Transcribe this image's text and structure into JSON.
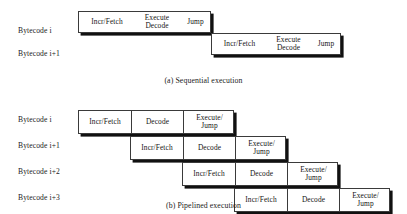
{
  "figure": {
    "sequential": {
      "caption": "(a) Sequential execution",
      "rows": [
        {
          "label": "Bytecode i",
          "stages": [
            {
              "name": "incr-fetch",
              "lines": [
                "Incr/Fetch"
              ]
            },
            {
              "name": "execute-decode",
              "lines": [
                "Execute",
                "Decode"
              ]
            },
            {
              "name": "jump",
              "lines": [
                "Jump"
              ]
            }
          ]
        },
        {
          "label": "Bytecode i+1",
          "stages": [
            {
              "name": "incr-fetch",
              "lines": [
                "Incr/Fetch"
              ]
            },
            {
              "name": "execute-decode",
              "lines": [
                "Execute",
                "Decode"
              ]
            },
            {
              "name": "jump",
              "lines": [
                "Jump"
              ]
            }
          ]
        }
      ]
    },
    "pipelined": {
      "caption": "(b) Pipelined execution",
      "rows": [
        {
          "label": "Bytecode i",
          "stages": [
            {
              "name": "incr-fetch",
              "lines": [
                "Incr/Fetch"
              ]
            },
            {
              "name": "decode",
              "lines": [
                "Decode"
              ]
            },
            {
              "name": "execute-jump",
              "lines": [
                "Execute/",
                "Jump"
              ]
            }
          ]
        },
        {
          "label": "Bytecode i+1",
          "stages": [
            {
              "name": "incr-fetch",
              "lines": [
                "Incr/Fetch"
              ]
            },
            {
              "name": "decode",
              "lines": [
                "Decode"
              ]
            },
            {
              "name": "execute-jump",
              "lines": [
                "Execute/",
                "Jump"
              ]
            }
          ]
        },
        {
          "label": "Bytecode i+2",
          "stages": [
            {
              "name": "incr-fetch",
              "lines": [
                "Incr/Fetch"
              ]
            },
            {
              "name": "decode",
              "lines": [
                "Decode"
              ]
            },
            {
              "name": "execute-jump",
              "lines": [
                "Execute/",
                "Jump"
              ]
            }
          ]
        },
        {
          "label": "Bytecode i+3",
          "stages": [
            {
              "name": "incr-fetch",
              "lines": [
                "Incr/Fetch"
              ]
            },
            {
              "name": "decode",
              "lines": [
                "Decode"
              ]
            },
            {
              "name": "execute-jump",
              "lines": [
                "Execute/",
                "Jump"
              ]
            }
          ]
        }
      ]
    }
  }
}
